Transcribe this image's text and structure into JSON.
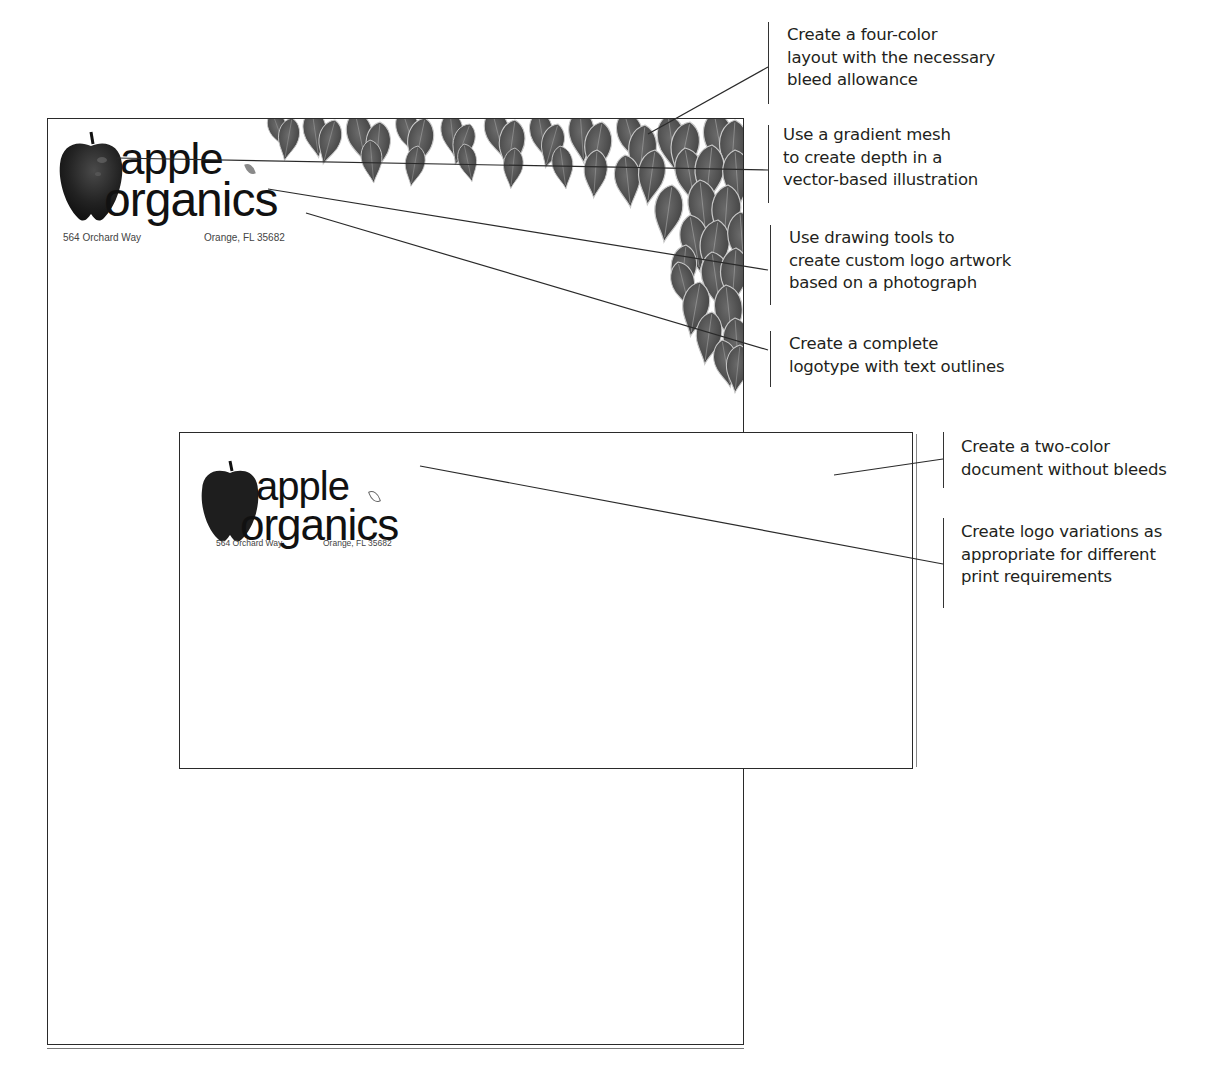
{
  "letterhead": {
    "logo": {
      "line1": "apple",
      "line2": "organics",
      "address_left": "564 Orchard Way",
      "address_right": "Orange, FL 35682",
      "style": "four-color with leaf border"
    }
  },
  "envelope": {
    "logo": {
      "line1": "apple",
      "line2": "organics",
      "address_left": "564 Orchard Way",
      "address_right": "Orange, FL 35682",
      "style": "two-color"
    }
  },
  "callouts": [
    {
      "id": "four-color",
      "lines": [
        "Create a four-color",
        "layout with the necessary",
        "bleed allowance"
      ]
    },
    {
      "id": "gradient-mesh",
      "lines": [
        "Use a gradient mesh",
        "to create depth in a",
        "vector-based illustration"
      ]
    },
    {
      "id": "drawing-tools",
      "lines": [
        "Use drawing tools to",
        "create custom logo artwork",
        "based on a photograph"
      ]
    },
    {
      "id": "logotype",
      "lines": [
        "Create a complete",
        "logotype with text outlines"
      ]
    },
    {
      "id": "two-color",
      "lines": [
        "Create a two-color",
        "document without bleeds"
      ]
    },
    {
      "id": "logo-variations",
      "lines": [
        "Create logo variations as",
        "appropriate for different",
        "print requirements"
      ]
    }
  ],
  "colors": {
    "ink": "#231f20",
    "leaf": "#555555",
    "leaf_vein": "#bdbdbd",
    "apple_dark": "#1a1a1a",
    "apple_highlight": "#4a4a4a",
    "leaf_accent": "#8a8a8a"
  }
}
